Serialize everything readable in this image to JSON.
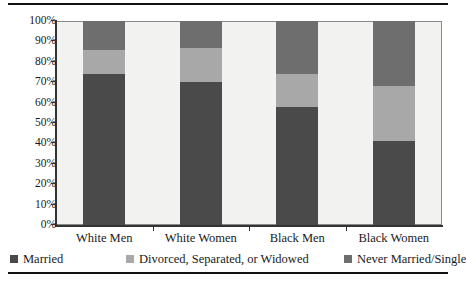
{
  "chart_data": {
    "type": "bar",
    "subtype": "stacked-bar-100-percent",
    "title": "",
    "xlabel": "",
    "ylabel": "",
    "ylim": [
      0,
      100
    ],
    "yticks": [
      "0%",
      "10%",
      "20%",
      "30%",
      "40%",
      "50%",
      "60%",
      "70%",
      "80%",
      "90%",
      "100%"
    ],
    "grid": false,
    "legend_position": "bottom",
    "categories": [
      "White Men",
      "White Women",
      "Black Men",
      "Black Women"
    ],
    "series": [
      {
        "name": "Married",
        "color": "#4a4a4a",
        "values": [
          74,
          70,
          58,
          41
        ]
      },
      {
        "name": "Divorced, Separated, or Widowed",
        "color": "#a8a8a8",
        "values": [
          12,
          17,
          16,
          27
        ]
      },
      {
        "name": "Never Married/Single",
        "color": "#6e6e6e",
        "values": [
          14,
          13,
          26,
          32
        ]
      }
    ]
  },
  "axis": {
    "y_tick_labels": [
      "100%",
      "90%",
      "80%",
      "70%",
      "60%",
      "50%",
      "40%",
      "30%",
      "20%",
      "10%",
      "0%"
    ],
    "x_tick_labels": [
      "White Men",
      "White Women",
      "Black Men",
      "Black Women"
    ]
  },
  "legend": {
    "items": [
      {
        "label": "Married",
        "color": "#4a4a4a"
      },
      {
        "label": "Divorced, Separated, or Widowed",
        "color": "#a8a8a8"
      },
      {
        "label": "Never Married/Single",
        "color": "#6e6e6e"
      }
    ]
  }
}
